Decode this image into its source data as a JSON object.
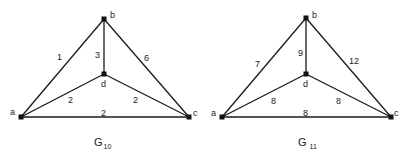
{
  "graphs": [
    {
      "name": "G10",
      "title_main": "G",
      "title_sub": "10",
      "vertices": {
        "a": {
          "label": "a",
          "x": 21,
          "y": 117
        },
        "b": {
          "label": "b",
          "x": 104,
          "y": 19
        },
        "c": {
          "label": "c",
          "x": 189,
          "y": 117
        },
        "d": {
          "label": "d",
          "x": 104,
          "y": 74
        }
      },
      "edges": [
        {
          "from": "a",
          "to": "b",
          "weight": "1"
        },
        {
          "from": "b",
          "to": "d",
          "weight": "3"
        },
        {
          "from": "b",
          "to": "c",
          "weight": "6"
        },
        {
          "from": "a",
          "to": "d",
          "weight": "2"
        },
        {
          "from": "d",
          "to": "c",
          "weight": "2"
        },
        {
          "from": "a",
          "to": "c",
          "weight": "2"
        }
      ]
    },
    {
      "name": "G11",
      "title_main": "G",
      "title_sub": "11",
      "vertices": {
        "a": {
          "label": "a",
          "x": 222,
          "y": 117
        },
        "b": {
          "label": "b",
          "x": 306,
          "y": 18
        },
        "c": {
          "label": "c",
          "x": 391,
          "y": 117
        },
        "d": {
          "label": "d",
          "x": 306,
          "y": 74
        }
      },
      "edges": [
        {
          "from": "a",
          "to": "b",
          "weight": "7"
        },
        {
          "from": "b",
          "to": "d",
          "weight": "9"
        },
        {
          "from": "b",
          "to": "c",
          "weight": "12"
        },
        {
          "from": "a",
          "to": "d",
          "weight": "8"
        },
        {
          "from": "d",
          "to": "c",
          "weight": "8"
        },
        {
          "from": "a",
          "to": "c",
          "weight": "8"
        }
      ]
    }
  ]
}
